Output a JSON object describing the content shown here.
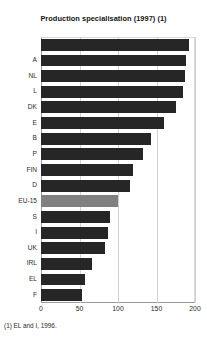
{
  "chart_data": {
    "type": "bar",
    "orientation": "horizontal",
    "title": "Production specialisation (1997) (1)",
    "footnote": "(1) EL and I, 1996.",
    "xlabel": "",
    "ylabel": "",
    "xlim": [
      0,
      200
    ],
    "xticks": [
      0,
      50,
      100,
      150,
      200
    ],
    "grid": true,
    "legend": "none",
    "highlight_category": "EU-15",
    "colors": {
      "bar": "#262626",
      "highlight_bar": "#808080",
      "gridline": "#d2d2d2",
      "axis": "#9a9a9a",
      "text": "#2b2b2b"
    },
    "categories": [
      "",
      "A",
      "NL",
      "L",
      "DK",
      "E",
      "B",
      "P",
      "FIN",
      "D",
      "EU-15",
      "S",
      "I",
      "UK",
      "IRL",
      "EL",
      "F"
    ],
    "values": [
      192,
      188,
      187,
      184,
      175,
      160,
      143,
      133,
      120,
      116,
      100,
      90,
      87,
      83,
      66,
      57,
      53
    ]
  }
}
